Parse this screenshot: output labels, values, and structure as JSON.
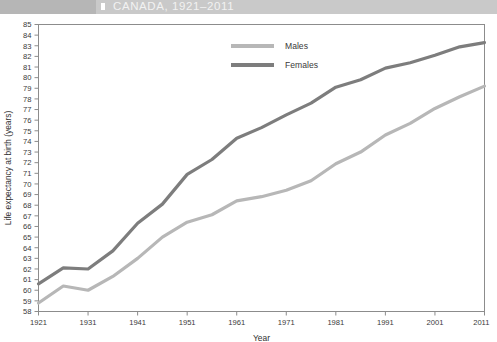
{
  "banner": {
    "title": "CANADA, 1921–2011",
    "band_color": "#c9c9c9",
    "band_left_color": "#b6b6b6",
    "title_color": "#f2f2f2"
  },
  "legend": {
    "position": "top-center",
    "entries": [
      {
        "label": "Males",
        "color": "#b7b7b7"
      },
      {
        "label": "Females",
        "color": "#7d7d7d"
      }
    ]
  },
  "chart_data": {
    "type": "line",
    "title": "CANADA, 1921–2011",
    "xlabel": "Year",
    "ylabel": "Life expectancy at birth (years)",
    "xlim": [
      1921,
      2011
    ],
    "ylim": [
      58,
      85
    ],
    "ytick_step": 1,
    "grid": false,
    "xticks": [
      1921,
      1931,
      1941,
      1951,
      1961,
      1971,
      1981,
      1991,
      2001,
      2011
    ],
    "xtick_labels": [
      "1921",
      "1931",
      "1941",
      "1951",
      "1961",
      "1971",
      "1981",
      "1991",
      "2001",
      "2011"
    ],
    "yticks": [
      58,
      59,
      60,
      61,
      62,
      63,
      64,
      65,
      66,
      67,
      68,
      69,
      70,
      71,
      72,
      73,
      74,
      75,
      76,
      77,
      78,
      79,
      80,
      81,
      82,
      83,
      84,
      85
    ],
    "ytick_labels": [
      "58",
      "59",
      "60",
      "61",
      "62",
      "63",
      "64",
      "65",
      "66",
      "67",
      "68",
      "69",
      "70",
      "71",
      "72",
      "73",
      "74",
      "75",
      "76",
      "77",
      "78",
      "79",
      "80",
      "81",
      "82",
      "83",
      "84",
      "85"
    ],
    "x": [
      1921,
      1926,
      1931,
      1936,
      1941,
      1946,
      1951,
      1956,
      1961,
      1966,
      1971,
      1976,
      1981,
      1986,
      1991,
      1996,
      2001,
      2006,
      2011
    ],
    "series": [
      {
        "name": "Males",
        "color": "#b7b7b7",
        "values": [
          58.8,
          60.4,
          60.0,
          61.3,
          63.0,
          65.0,
          66.4,
          67.1,
          68.4,
          68.8,
          69.4,
          70.3,
          71.9,
          73.0,
          74.6,
          75.7,
          77.1,
          78.2,
          79.2
        ]
      },
      {
        "name": "Females",
        "color": "#7d7d7d",
        "values": [
          60.6,
          62.1,
          62.0,
          63.7,
          66.3,
          68.1,
          70.9,
          72.3,
          74.3,
          75.3,
          76.5,
          77.6,
          79.1,
          79.8,
          80.9,
          81.4,
          82.1,
          82.9,
          83.3
        ]
      }
    ]
  }
}
